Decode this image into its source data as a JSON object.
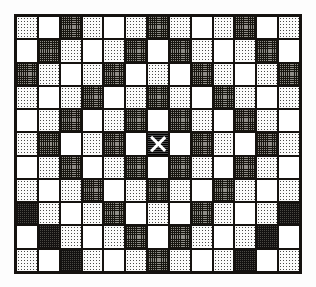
{
  "figure": {
    "title": "",
    "type": "grid-pattern-diagram",
    "columns": 13,
    "rows": 11,
    "frame_color": "#15120f",
    "background_color": "#ffffff",
    "legend": {
      "white": "empty cell",
      "stipple": "light stippled cell",
      "grid": "dark crosshatched cell",
      "checker": "dense checkered cell",
      "marker": "center cell marked with X"
    },
    "center_cell": {
      "row": 6,
      "column": 7,
      "marker": "X"
    },
    "cells": [
      [
        "stipple",
        "white",
        "grid",
        "stipple",
        "white",
        "stipple",
        "grid",
        "stipple",
        "white",
        "stipple",
        "grid",
        "white",
        "stipple"
      ],
      [
        "white",
        "grid",
        "stipple",
        "white",
        "stipple",
        "grid",
        "white",
        "grid",
        "stipple",
        "white",
        "stipple",
        "grid",
        "white"
      ],
      [
        "grid",
        "stipple",
        "white",
        "stipple",
        "grid",
        "white",
        "stipple",
        "white",
        "grid",
        "stipple",
        "white",
        "stipple",
        "grid"
      ],
      [
        "stipple",
        "white",
        "stipple",
        "grid",
        "white",
        "stipple",
        "grid",
        "stipple",
        "white",
        "grid",
        "stipple",
        "white",
        "stipple"
      ],
      [
        "white",
        "stipple",
        "grid",
        "white",
        "stipple",
        "grid",
        "white",
        "grid",
        "stipple",
        "white",
        "grid",
        "stipple",
        "white"
      ],
      [
        "stipple",
        "grid",
        "white",
        "stipple",
        "grid",
        "white",
        "marker",
        "white",
        "grid",
        "stipple",
        "white",
        "grid",
        "stipple"
      ],
      [
        "white",
        "stipple",
        "grid",
        "white",
        "stipple",
        "grid",
        "white",
        "grid",
        "stipple",
        "white",
        "grid",
        "stipple",
        "white"
      ],
      [
        "stipple",
        "white",
        "stipple",
        "grid",
        "white",
        "stipple",
        "grid",
        "stipple",
        "white",
        "grid",
        "stipple",
        "white",
        "stipple"
      ],
      [
        "checker",
        "stipple",
        "white",
        "stipple",
        "grid",
        "white",
        "stipple",
        "white",
        "grid",
        "stipple",
        "white",
        "stipple",
        "checker"
      ],
      [
        "white",
        "checker",
        "stipple",
        "white",
        "stipple",
        "grid",
        "white",
        "grid",
        "stipple",
        "white",
        "stipple",
        "checker",
        "white"
      ],
      [
        "stipple",
        "white",
        "checker",
        "stipple",
        "white",
        "stipple",
        "grid",
        "stipple",
        "white",
        "stipple",
        "checker",
        "white",
        "stipple"
      ]
    ]
  }
}
